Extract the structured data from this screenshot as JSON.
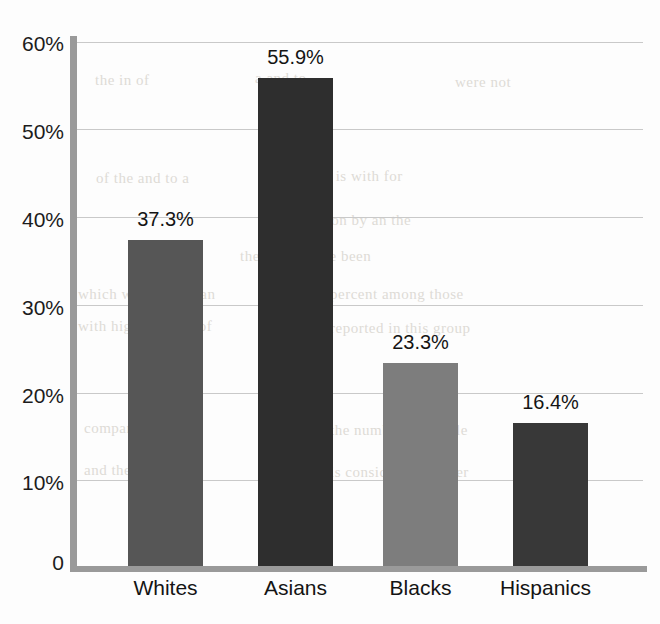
{
  "chart_data": {
    "type": "bar",
    "title": "",
    "subtitle": "",
    "xlabel": "",
    "ylabel": "",
    "categories": [
      "Whites",
      "Asians",
      "Blacks",
      "Hispanics"
    ],
    "values": [
      37.3,
      55.9,
      23.3,
      16.4
    ],
    "value_labels": [
      "37.3%",
      "55.9%",
      "23.3%",
      "16.4%"
    ],
    "bar_colors": [
      "#565656",
      "#2e2e2e",
      "#7d7d7d",
      "#383838"
    ],
    "ylim": [
      0,
      60
    ],
    "y_ticks": [
      0,
      10,
      20,
      30,
      40,
      50,
      60
    ],
    "y_tick_labels": [
      "0",
      "10%",
      "20%",
      "30%",
      "40%",
      "50%",
      "60%"
    ],
    "grid": true,
    "grid_color": "#c9c9c9",
    "axis_color": "#9a9a9a",
    "legend": "none",
    "legend_position": "none"
  },
  "background_bleed": [
    "the in of",
    "a and to",
    "were not",
    "of the and to a",
    "in that is with for",
    "as it on by an the",
    "their they have been",
    "which was more than",
    "percent among those",
    "with higher levels of",
    "reported in this group",
    "compared to other",
    "the number of people",
    "and the share who",
    "is considerably lower"
  ]
}
